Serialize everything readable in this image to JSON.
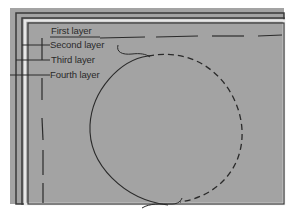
{
  "diagram": {
    "background_color": "#a3a3a3",
    "line_color": "#2a2a2a",
    "labels": [
      {
        "id": "first",
        "text": "First layer"
      },
      {
        "id": "second",
        "text": "Second layer"
      },
      {
        "id": "third",
        "text": "Third layer"
      },
      {
        "id": "fourth",
        "text": "Fourth layer"
      }
    ],
    "shapes": {
      "circle": {
        "style": "solid-left, dashed-right",
        "description": "Circle outline drawn half solid, half dashed"
      },
      "top_dashed_line": {
        "style": "long-dash"
      },
      "left_dashed_line": {
        "style": "long-dash"
      }
    }
  }
}
